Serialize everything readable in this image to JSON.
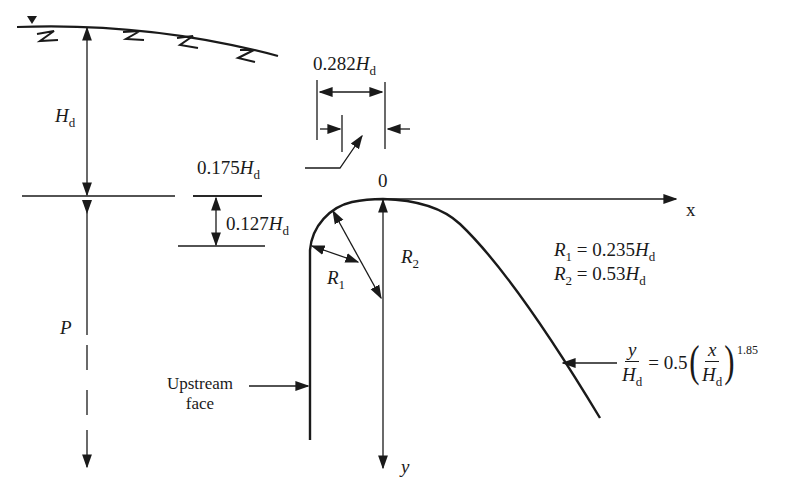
{
  "diagram": {
    "colors": {
      "stroke": "#1a1a1a",
      "background": "#ffffff"
    },
    "labels": {
      "design_head": {
        "symbol": "H",
        "subscript": "d"
      },
      "crest_height": {
        "symbol": "P"
      },
      "dim_0282": {
        "value": "0.282",
        "symbol": "H",
        "subscript": "d"
      },
      "dim_0175": {
        "value": "0.175",
        "symbol": "H",
        "subscript": "d"
      },
      "dim_0127": {
        "value": "0.127",
        "symbol": "H",
        "subscript": "d"
      },
      "origin": "0",
      "x_axis": "x",
      "y_axis": "y",
      "r1_label": {
        "symbol": "R",
        "subscript": "1"
      },
      "r2_label": {
        "symbol": "R",
        "subscript": "2"
      },
      "upstream_face_line1": "Upstream",
      "upstream_face_line2": "face"
    },
    "radii": [
      {
        "symbol": "R",
        "subscript": "1",
        "equals": "= 0.235",
        "unit_symbol": "H",
        "unit_subscript": "d"
      },
      {
        "symbol": "R",
        "subscript": "2",
        "equals": "= 0.53",
        "unit_symbol": "H",
        "unit_subscript": "d"
      }
    ],
    "equation": {
      "lhs_num": "y",
      "lhs_den_symbol": "H",
      "lhs_den_subscript": "d",
      "coef": "= 0.5",
      "rhs_num": "x",
      "rhs_den_symbol": "H",
      "rhs_den_subscript": "d",
      "exponent": "1.85",
      "open_paren": "(",
      "close_paren": ")"
    }
  }
}
